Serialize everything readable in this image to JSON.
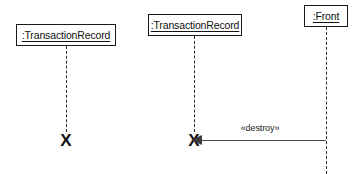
{
  "diagram": {
    "type": "uml-sequence-diagram",
    "title": "",
    "background_color": "#ffffff",
    "line_color": "#1a1a1a",
    "arrow_color": "#3c3c3c",
    "lifelines": [
      {
        "id": "transaction-record-1",
        "label": ":TransactionRecord",
        "box": {
          "x": 16,
          "y": 24,
          "width": 100,
          "height": 22
        },
        "lifeline_x": 66,
        "lifeline_top": 46,
        "lifeline_bottom": 132,
        "terminated": true,
        "termination": {
          "marker": "X",
          "x": 66,
          "y": 140
        }
      },
      {
        "id": "transaction-record-2",
        "label": ":TransactionRecord",
        "box": {
          "x": 148,
          "y": 14,
          "width": 94,
          "height": 22
        },
        "lifeline_x": 194,
        "lifeline_top": 36,
        "lifeline_bottom": 132,
        "terminated": true,
        "termination": {
          "marker": "X",
          "x": 194,
          "y": 140
        }
      },
      {
        "id": "front",
        "label": ":Front",
        "box": {
          "x": 304,
          "y": 5,
          "width": 44,
          "height": 22
        },
        "lifeline_x": 326,
        "lifeline_top": 27,
        "lifeline_bottom": 174,
        "terminated": false,
        "termination": null
      }
    ],
    "messages": [
      {
        "id": "destroy-message",
        "label": "«destroy»",
        "stereotype": "destroy",
        "from": "front",
        "to": "transaction-record-2",
        "direction": "right-to-left",
        "arrow_style": "solid-filled-head",
        "y": 140,
        "x_start": 326,
        "x_end": 202,
        "label_x": 260,
        "label_y": 127
      }
    ]
  }
}
